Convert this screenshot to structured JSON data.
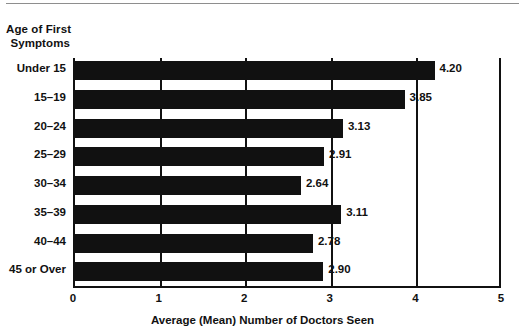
{
  "chart_data": {
    "type": "bar",
    "orientation": "horizontal",
    "title": "",
    "ylabel": "Age of First Symptoms",
    "ylabel_lines": [
      "Age of First",
      "Symptoms"
    ],
    "xlabel": "Average (Mean) Number of Doctors Seen",
    "categories": [
      "Under 15",
      "15–19",
      "20–24",
      "25–29",
      "30–34",
      "35–39",
      "40–44",
      "45 or Over"
    ],
    "values": [
      4.2,
      3.85,
      3.13,
      2.91,
      2.64,
      3.11,
      2.78,
      2.9
    ],
    "value_labels": [
      "4.20",
      "3.85",
      "3.13",
      "2.91",
      "2.64",
      "3.11",
      "2.78",
      "2.90"
    ],
    "xlim": [
      0,
      5
    ],
    "xticks": [
      0,
      1,
      2,
      3,
      4,
      5
    ],
    "xtick_labels": [
      "0",
      "1",
      "2",
      "3",
      "4",
      "5"
    ],
    "grid": true,
    "grid_axis": "x",
    "legend": false,
    "bar_color": "#111111",
    "grid_color": "#111111",
    "background_color": "#ffffff"
  }
}
